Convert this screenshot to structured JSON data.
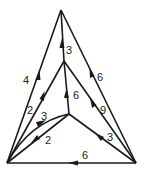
{
  "diagram": {
    "type": "directed-weighted-graph",
    "nodes": [
      {
        "id": "T",
        "x": 61,
        "y": 10
      },
      {
        "id": "M",
        "x": 64,
        "y": 61
      },
      {
        "id": "C",
        "x": 69,
        "y": 114
      },
      {
        "id": "BL",
        "x": 7,
        "y": 163
      },
      {
        "id": "BR",
        "x": 136,
        "y": 163
      }
    ],
    "edges": [
      {
        "id": "e1",
        "from": "BL",
        "to": "T",
        "weight": "4",
        "label_x": 23,
        "label_y": 84
      },
      {
        "id": "e2",
        "from": "BR",
        "to": "T",
        "weight": "6",
        "label_x": 97,
        "label_y": 81
      },
      {
        "id": "e3",
        "from": "M",
        "to": "T",
        "weight": "3",
        "label_x": 66,
        "label_y": 54
      },
      {
        "id": "e4",
        "from": "BL",
        "to": "M",
        "weight": "2",
        "label_x": 27,
        "label_y": 114
      },
      {
        "id": "e5",
        "from": "C",
        "to": "M",
        "weight": "6",
        "label_x": 73,
        "label_y": 99
      },
      {
        "id": "e6",
        "from": "BR",
        "to": "M",
        "weight": "9",
        "label_x": 100,
        "label_y": 114
      },
      {
        "id": "e7",
        "from": "BL",
        "to": "C",
        "weight": "3",
        "label_x": 41,
        "label_y": 120
      },
      {
        "id": "e8",
        "from": "C",
        "to": "BL",
        "weight": "2",
        "label_x": 45,
        "label_y": 144
      },
      {
        "id": "e9",
        "from": "BR",
        "to": "C",
        "weight": "3",
        "label_x": 107,
        "label_y": 141
      },
      {
        "id": "e10",
        "from": "BR",
        "to": "BL",
        "weight": "6",
        "label_x": 82,
        "label_y": 159
      }
    ]
  }
}
